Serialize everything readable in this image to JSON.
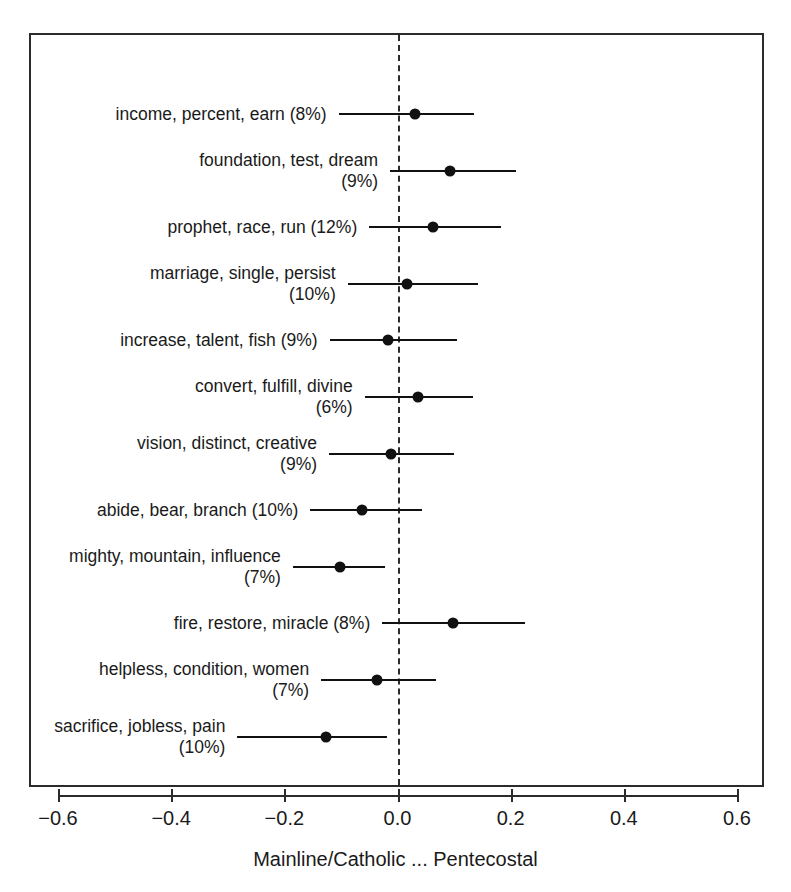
{
  "chart_data": {
    "type": "scatter",
    "title": "",
    "subtitle": "",
    "xlabel": "Mainline/Catholic ... Pentecostal",
    "ylabel": "",
    "xlim": [
      -0.72,
      0.65
    ],
    "xticks": [
      -0.6,
      -0.4,
      -0.2,
      0.0,
      0.2,
      0.4,
      0.6
    ],
    "xticklabels": [
      "−0.6",
      "−0.4",
      "−0.2",
      "0.0",
      "0.2",
      "0.4",
      "0.6"
    ],
    "grid": false,
    "legend": null,
    "zero_reference_line": 0.0,
    "zero_reference_style": "dashed",
    "point_color": "#111111",
    "line_color": "#111111",
    "frame_color": "#2b2b2b",
    "series": [
      {
        "name": "topic effects",
        "categories": [
          "income, percent, earn (8%)",
          "foundation, test, dream\n(9%)",
          "prophet, race, run (12%)",
          "marriage, single, persist\n(10%)",
          "increase, talent, fish (9%)",
          "convert, fulfill, divine\n(6%)",
          "vision, distinct, creative\n(9%)",
          "abide, bear, branch (10%)",
          "mighty, mountain, influence\n(7%)",
          "fire, restore, miracle (8%)",
          "helpless, condition, women\n(7%)",
          "sacrifice, jobless, pain\n(10%)"
        ],
        "estimates": [
          0.031,
          0.093,
          0.062,
          0.016,
          -0.016,
          0.036,
          -0.012,
          -0.062,
          -0.102,
          0.098,
          -0.036,
          -0.127
        ],
        "ci_low": [
          -0.104,
          -0.013,
          -0.05,
          -0.088,
          -0.12,
          -0.058,
          -0.121,
          -0.154,
          -0.185,
          -0.027,
          -0.135,
          -0.283
        ],
        "ci_high": [
          0.136,
          0.21,
          0.183,
          0.143,
          0.106,
          0.133,
          0.1,
          0.043,
          -0.022,
          0.225,
          0.068,
          -0.019
        ]
      }
    ],
    "rows": [
      {
        "label": "income, percent, earn (8%)",
        "terms": [
          "income",
          "percent",
          "earn"
        ],
        "proportion": "8%",
        "estimate": 0.031,
        "ci_low": -0.104,
        "ci_high": 0.136,
        "lines": 1
      },
      {
        "label": "foundation, test, dream\n(9%)",
        "terms": [
          "foundation",
          "test",
          "dream"
        ],
        "proportion": "9%",
        "estimate": 0.093,
        "ci_low": -0.013,
        "ci_high": 0.21,
        "lines": 2
      },
      {
        "label": "prophet, race, run (12%)",
        "terms": [
          "prophet",
          "race",
          "run"
        ],
        "proportion": "12%",
        "estimate": 0.062,
        "ci_low": -0.05,
        "ci_high": 0.183,
        "lines": 1
      },
      {
        "label": "marriage, single, persist\n(10%)",
        "terms": [
          "marriage",
          "single",
          "persist"
        ],
        "proportion": "10%",
        "estimate": 0.016,
        "ci_low": -0.088,
        "ci_high": 0.143,
        "lines": 2
      },
      {
        "label": "increase, talent, fish (9%)",
        "terms": [
          "increase",
          "talent",
          "fish"
        ],
        "proportion": "9%",
        "estimate": -0.016,
        "ci_low": -0.12,
        "ci_high": 0.106,
        "lines": 1
      },
      {
        "label": "convert, fulfill, divine\n(6%)",
        "terms": [
          "convert",
          "fulfill",
          "divine"
        ],
        "proportion": "6%",
        "estimate": 0.036,
        "ci_low": -0.058,
        "ci_high": 0.133,
        "lines": 2
      },
      {
        "label": "vision, distinct, creative\n(9%)",
        "terms": [
          "vision",
          "distinct",
          "creative"
        ],
        "proportion": "9%",
        "estimate": -0.012,
        "ci_low": -0.121,
        "ci_high": 0.1,
        "lines": 2
      },
      {
        "label": "abide, bear, branch (10%)",
        "terms": [
          "abide",
          "bear",
          "branch"
        ],
        "proportion": "10%",
        "estimate": -0.062,
        "ci_low": -0.154,
        "ci_high": 0.043,
        "lines": 1
      },
      {
        "label": "mighty, mountain, influence\n(7%)",
        "terms": [
          "mighty",
          "mountain",
          "influence"
        ],
        "proportion": "7%",
        "estimate": -0.102,
        "ci_low": -0.185,
        "ci_high": -0.022,
        "lines": 2
      },
      {
        "label": "fire, restore, miracle (8%)",
        "terms": [
          "fire",
          "restore",
          "miracle"
        ],
        "proportion": "8%",
        "estimate": 0.098,
        "ci_low": -0.027,
        "ci_high": 0.225,
        "lines": 1
      },
      {
        "label": "helpless, condition, women\n(7%)",
        "terms": [
          "helpless",
          "condition",
          "women"
        ],
        "proportion": "7%",
        "estimate": -0.036,
        "ci_low": -0.135,
        "ci_high": 0.068,
        "lines": 2
      },
      {
        "label": "sacrifice, jobless, pain\n(10%)",
        "terms": [
          "sacrifice",
          "jobless",
          "pain"
        ],
        "proportion": "10%",
        "estimate": -0.127,
        "ci_low": -0.283,
        "ci_high": -0.019,
        "lines": 2
      }
    ]
  }
}
